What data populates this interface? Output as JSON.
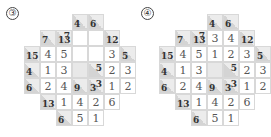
{
  "puzzles": [
    {
      "label": "③",
      "cells": [
        {
          "r": 0,
          "c": 3,
          "type": "clue",
          "down": "4",
          "across": ""
        },
        {
          "r": 0,
          "c": 4,
          "type": "clue",
          "down": "6",
          "across": ""
        },
        {
          "r": 1,
          "c": 1,
          "type": "clue",
          "down": "7",
          "across": ""
        },
        {
          "r": 1,
          "c": 2,
          "type": "clue",
          "down": "13",
          "across": "7"
        },
        {
          "r": 1,
          "c": 3,
          "type": "val",
          "v": ""
        },
        {
          "r": 1,
          "c": 4,
          "type": "val",
          "v": ""
        },
        {
          "r": 1,
          "c": 5,
          "type": "clue",
          "down": "12",
          "across": ""
        },
        {
          "r": 2,
          "c": 0,
          "type": "clue",
          "down": "15",
          "across": ""
        },
        {
          "r": 2,
          "c": 1,
          "type": "val",
          "v": "4"
        },
        {
          "r": 2,
          "c": 2,
          "type": "val",
          "v": "5"
        },
        {
          "r": 2,
          "c": 3,
          "type": "val",
          "v": ""
        },
        {
          "r": 2,
          "c": 4,
          "type": "val",
          "v": ""
        },
        {
          "r": 2,
          "c": 5,
          "type": "val",
          "v": "3"
        },
        {
          "r": 2,
          "c": 6,
          "type": "clue",
          "down": "5",
          "across": ""
        },
        {
          "r": 3,
          "c": 0,
          "type": "clue",
          "down": "4",
          "across": ""
        },
        {
          "r": 3,
          "c": 1,
          "type": "val",
          "v": "1"
        },
        {
          "r": 3,
          "c": 2,
          "type": "val",
          "v": "3"
        },
        {
          "r": 3,
          "c": 3,
          "type": "blank"
        },
        {
          "r": 3,
          "c": 4,
          "type": "clue",
          "down": "",
          "across": "5"
        },
        {
          "r": 3,
          "c": 5,
          "type": "val",
          "v": "2"
        },
        {
          "r": 3,
          "c": 6,
          "type": "val",
          "v": "3"
        },
        {
          "r": 4,
          "c": 0,
          "type": "clue",
          "down": "6",
          "across": ""
        },
        {
          "r": 4,
          "c": 1,
          "type": "val",
          "v": "2"
        },
        {
          "r": 4,
          "c": 2,
          "type": "val",
          "v": "4"
        },
        {
          "r": 4,
          "c": 3,
          "type": "clue",
          "down": "9",
          "across": ""
        },
        {
          "r": 4,
          "c": 4,
          "type": "clue",
          "down": "3",
          "across": "3"
        },
        {
          "r": 4,
          "c": 5,
          "type": "val",
          "v": "1"
        },
        {
          "r": 4,
          "c": 6,
          "type": "val",
          "v": "2"
        },
        {
          "r": 5,
          "c": 1,
          "type": "clue",
          "down": "13",
          "across": ""
        },
        {
          "r": 5,
          "c": 2,
          "type": "val",
          "v": "1"
        },
        {
          "r": 5,
          "c": 3,
          "type": "val",
          "v": "4"
        },
        {
          "r": 5,
          "c": 4,
          "type": "val",
          "v": "2"
        },
        {
          "r": 5,
          "c": 5,
          "type": "val",
          "v": "6"
        },
        {
          "r": 6,
          "c": 2,
          "type": "clue",
          "down": "6",
          "across": ""
        },
        {
          "r": 6,
          "c": 3,
          "type": "val",
          "v": "5"
        },
        {
          "r": 6,
          "c": 4,
          "type": "val",
          "v": "1"
        }
      ]
    },
    {
      "label": "④",
      "cells": [
        {
          "r": 0,
          "c": 3,
          "type": "clue",
          "down": "4",
          "across": ""
        },
        {
          "r": 0,
          "c": 4,
          "type": "clue",
          "down": "6",
          "across": ""
        },
        {
          "r": 1,
          "c": 1,
          "type": "clue",
          "down": "7",
          "across": ""
        },
        {
          "r": 1,
          "c": 2,
          "type": "clue",
          "down": "13",
          "across": "7"
        },
        {
          "r": 1,
          "c": 3,
          "type": "val",
          "v": "3"
        },
        {
          "r": 1,
          "c": 4,
          "type": "val",
          "v": "4"
        },
        {
          "r": 1,
          "c": 5,
          "type": "clue",
          "down": "12",
          "across": ""
        },
        {
          "r": 2,
          "c": 0,
          "type": "clue",
          "down": "15",
          "across": ""
        },
        {
          "r": 2,
          "c": 1,
          "type": "val",
          "v": "4"
        },
        {
          "r": 2,
          "c": 2,
          "type": "val",
          "v": "5"
        },
        {
          "r": 2,
          "c": 3,
          "type": "val",
          "v": "1"
        },
        {
          "r": 2,
          "c": 4,
          "type": "val",
          "v": "2"
        },
        {
          "r": 2,
          "c": 5,
          "type": "val",
          "v": "3"
        },
        {
          "r": 2,
          "c": 6,
          "type": "clue",
          "down": "5",
          "across": ""
        },
        {
          "r": 3,
          "c": 0,
          "type": "clue",
          "down": "4",
          "across": ""
        },
        {
          "r": 3,
          "c": 1,
          "type": "val",
          "v": "1"
        },
        {
          "r": 3,
          "c": 2,
          "type": "val",
          "v": "3"
        },
        {
          "r": 3,
          "c": 3,
          "type": "blank"
        },
        {
          "r": 3,
          "c": 4,
          "type": "clue",
          "down": "",
          "across": "5"
        },
        {
          "r": 3,
          "c": 5,
          "type": "val",
          "v": "2"
        },
        {
          "r": 3,
          "c": 6,
          "type": "val",
          "v": "3"
        },
        {
          "r": 4,
          "c": 0,
          "type": "clue",
          "down": "6",
          "across": ""
        },
        {
          "r": 4,
          "c": 1,
          "type": "val",
          "v": "2"
        },
        {
          "r": 4,
          "c": 2,
          "type": "val",
          "v": "4"
        },
        {
          "r": 4,
          "c": 3,
          "type": "clue",
          "down": "9",
          "across": ""
        },
        {
          "r": 4,
          "c": 4,
          "type": "clue",
          "down": "3",
          "across": "3"
        },
        {
          "r": 4,
          "c": 5,
          "type": "val",
          "v": "1"
        },
        {
          "r": 4,
          "c": 6,
          "type": "val",
          "v": "2"
        },
        {
          "r": 5,
          "c": 1,
          "type": "clue",
          "down": "13",
          "across": ""
        },
        {
          "r": 5,
          "c": 2,
          "type": "val",
          "v": "1"
        },
        {
          "r": 5,
          "c": 3,
          "type": "val",
          "v": "4"
        },
        {
          "r": 5,
          "c": 4,
          "type": "val",
          "v": "2"
        },
        {
          "r": 5,
          "c": 5,
          "type": "val",
          "v": "6"
        },
        {
          "r": 6,
          "c": 2,
          "type": "clue",
          "down": "6",
          "across": ""
        },
        {
          "r": 6,
          "c": 3,
          "type": "val",
          "v": "5"
        },
        {
          "r": 6,
          "c": 4,
          "type": "val",
          "v": "1"
        }
      ]
    }
  ]
}
